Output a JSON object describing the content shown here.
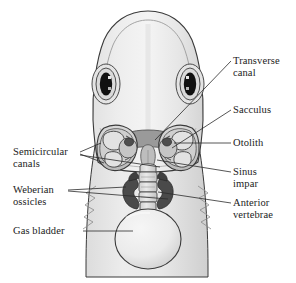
{
  "figure": {
    "background_color": "#ffffff",
    "line_color": "#2b2b2b",
    "label_text_color": "#1b1b1b",
    "body_fill_light": "#efefef",
    "body_fill_mid": "#d8d8d8",
    "shadow_gray": "#9a9a9a",
    "dark_gray": "#555555",
    "ossicle_dark": "#4a4a4a",
    "eye_black": "#111111"
  },
  "labels": {
    "transverse_canal": {
      "text": "Transverse\ncanal",
      "side": "right",
      "x": 233,
      "y": 55
    },
    "sacculus": {
      "text": "Sacculus",
      "side": "right",
      "x": 233,
      "y": 108
    },
    "otolith": {
      "text": "Otolith",
      "side": "right",
      "x": 233,
      "y": 141
    },
    "sinus_impar": {
      "text": "Sinus\nimpar",
      "side": "right",
      "x": 233,
      "y": 170
    },
    "anterior_vertebrae": {
      "text": "Anterior\nvertebrae",
      "side": "right",
      "x": 233,
      "y": 201
    },
    "semicircular_canals": {
      "text": "Semicircular\ncanals",
      "side": "left",
      "x": 13,
      "y": 148
    },
    "weberian_ossicles": {
      "text": "Weberian\nossicles",
      "side": "left",
      "x": 13,
      "y": 185
    },
    "gas_bladder": {
      "text": "Gas bladder",
      "side": "left",
      "x": 13,
      "y": 227
    }
  },
  "structures": [
    {
      "name": "fish-head-outline",
      "description": "Dorsal outline of fish head and anterior body"
    },
    {
      "name": "left-eye",
      "description": "Left eye with black pupil"
    },
    {
      "name": "right-eye",
      "description": "Right eye with black pupil"
    },
    {
      "name": "left-semicircular-canals",
      "description": "Left labyrinth semicircular canals"
    },
    {
      "name": "right-semicircular-canals",
      "description": "Right labyrinth semicircular canals"
    },
    {
      "name": "left-otolith",
      "description": "Dark otolith in left sacculus"
    },
    {
      "name": "right-otolith",
      "description": "Dark otolith in right sacculus"
    },
    {
      "name": "transverse-canal",
      "description": "Transverse canal joining the two sacculi"
    },
    {
      "name": "sinus-impar",
      "description": "Median sinus impar below transverse canal"
    },
    {
      "name": "weberian-ossicles",
      "description": "Chain of dark Weberian ossicles"
    },
    {
      "name": "anterior-vertebrae",
      "description": "Anterior vertebral column segments"
    },
    {
      "name": "gas-bladder",
      "description": "Ovoid gas bladder"
    }
  ]
}
